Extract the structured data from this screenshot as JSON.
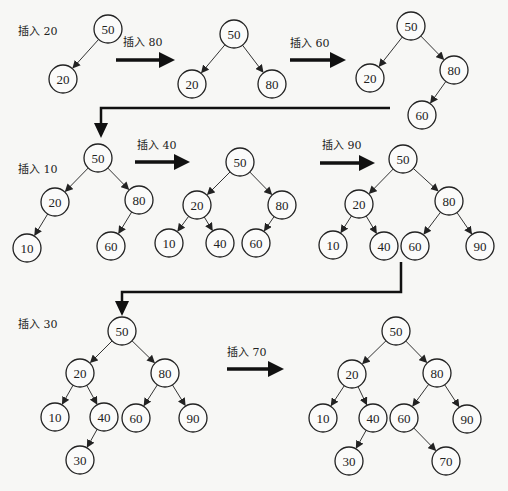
{
  "diagram": {
    "colors": {
      "stroke": "#222222",
      "background": "#f7f7f5",
      "node_fill": "#fbfbfa"
    },
    "node_radius": 14,
    "steps": [
      {
        "label": "插入 20",
        "label_pos": [
          18,
          35
        ],
        "nodes": [
          {
            "v": "50",
            "x": 108,
            "y": 29
          },
          {
            "v": "20",
            "x": 63,
            "y": 79
          }
        ],
        "edges": [
          [
            "50",
            "20"
          ]
        ]
      },
      {
        "label": "插入 80",
        "label_pos": [
          123,
          46
        ],
        "arrow": {
          "x1": 116,
          "y1": 60,
          "x2": 175,
          "y2": 60
        },
        "nodes": [
          {
            "v": "50",
            "x": 234,
            "y": 34
          },
          {
            "v": "20",
            "x": 192,
            "y": 84
          },
          {
            "v": "80",
            "x": 272,
            "y": 84
          }
        ],
        "edges": [
          [
            "50",
            "20"
          ],
          [
            "50",
            "80"
          ]
        ]
      },
      {
        "label": "插入 60",
        "label_pos": [
          290,
          47
        ],
        "arrow": {
          "x1": 290,
          "y1": 60,
          "x2": 346,
          "y2": 60
        },
        "nodes": [
          {
            "v": "50",
            "x": 411,
            "y": 26
          },
          {
            "v": "20",
            "x": 370,
            "y": 78
          },
          {
            "v": "80",
            "x": 454,
            "y": 70
          },
          {
            "v": "60",
            "x": 422,
            "y": 115
          }
        ],
        "edges": [
          [
            "50",
            "20"
          ],
          [
            "50",
            "80"
          ],
          [
            "80",
            "60"
          ]
        ]
      },
      {
        "label": "插入 10",
        "label_pos": [
          18,
          173
        ],
        "nodes": [
          {
            "v": "50",
            "x": 98,
            "y": 158
          },
          {
            "v": "20",
            "x": 55,
            "y": 202
          },
          {
            "v": "80",
            "x": 139,
            "y": 200
          },
          {
            "v": "10",
            "x": 27,
            "y": 248
          },
          {
            "v": "60",
            "x": 111,
            "y": 246
          }
        ],
        "edges": [
          [
            "50",
            "20"
          ],
          [
            "50",
            "80"
          ],
          [
            "20",
            "10"
          ],
          [
            "80",
            "60"
          ]
        ]
      },
      {
        "label": "插入 40",
        "label_pos": [
          137,
          149
        ],
        "arrow": {
          "x1": 135,
          "y1": 162,
          "x2": 190,
          "y2": 162
        },
        "nodes": [
          {
            "v": "50",
            "x": 240,
            "y": 162
          },
          {
            "v": "20",
            "x": 197,
            "y": 205
          },
          {
            "v": "80",
            "x": 282,
            "y": 205
          },
          {
            "v": "10",
            "x": 169,
            "y": 243
          },
          {
            "v": "40",
            "x": 220,
            "y": 243
          },
          {
            "v": "60",
            "x": 256,
            "y": 243
          }
        ],
        "edges": [
          [
            "50",
            "20"
          ],
          [
            "50",
            "80"
          ],
          [
            "20",
            "10"
          ],
          [
            "20",
            "40"
          ],
          [
            "80",
            "60"
          ]
        ]
      },
      {
        "label": "插入 90",
        "label_pos": [
          322,
          149
        ],
        "arrow": {
          "x1": 320,
          "y1": 163,
          "x2": 375,
          "y2": 163
        },
        "nodes": [
          {
            "v": "50",
            "x": 403,
            "y": 159
          },
          {
            "v": "20",
            "x": 359,
            "y": 204
          },
          {
            "v": "80",
            "x": 449,
            "y": 201
          },
          {
            "v": "10",
            "x": 333,
            "y": 245
          },
          {
            "v": "40",
            "x": 384,
            "y": 246
          },
          {
            "v": "60",
            "x": 415,
            "y": 246
          },
          {
            "v": "90",
            "x": 480,
            "y": 246
          }
        ],
        "edges": [
          [
            "50",
            "20"
          ],
          [
            "50",
            "80"
          ],
          [
            "20",
            "10"
          ],
          [
            "20",
            "40"
          ],
          [
            "80",
            "60"
          ],
          [
            "80",
            "90"
          ]
        ]
      },
      {
        "label": "插入 30",
        "label_pos": [
          18,
          328
        ],
        "nodes": [
          {
            "v": "50",
            "x": 122,
            "y": 331
          },
          {
            "v": "20",
            "x": 80,
            "y": 373
          },
          {
            "v": "80",
            "x": 165,
            "y": 373
          },
          {
            "v": "10",
            "x": 55,
            "y": 417
          },
          {
            "v": "40",
            "x": 104,
            "y": 417
          },
          {
            "v": "60",
            "x": 136,
            "y": 418
          },
          {
            "v": "90",
            "x": 193,
            "y": 418
          },
          {
            "v": "30",
            "x": 80,
            "y": 460
          }
        ],
        "edges": [
          [
            "50",
            "20"
          ],
          [
            "50",
            "80"
          ],
          [
            "20",
            "10"
          ],
          [
            "20",
            "40"
          ],
          [
            "80",
            "60"
          ],
          [
            "80",
            "90"
          ],
          [
            "40",
            "30"
          ]
        ]
      },
      {
        "label": "插入 70",
        "label_pos": [
          227,
          356
        ],
        "arrow": {
          "x1": 227,
          "y1": 369,
          "x2": 284,
          "y2": 369
        },
        "nodes": [
          {
            "v": "50",
            "x": 396,
            "y": 331
          },
          {
            "v": "20",
            "x": 352,
            "y": 374
          },
          {
            "v": "80",
            "x": 437,
            "y": 373
          },
          {
            "v": "10",
            "x": 323,
            "y": 418
          },
          {
            "v": "40",
            "x": 373,
            "y": 418
          },
          {
            "v": "60",
            "x": 404,
            "y": 418
          },
          {
            "v": "90",
            "x": 467,
            "y": 419
          },
          {
            "v": "30",
            "x": 349,
            "y": 461
          },
          {
            "v": "70",
            "x": 446,
            "y": 461
          }
        ],
        "edges": [
          [
            "50",
            "20"
          ],
          [
            "50",
            "80"
          ],
          [
            "20",
            "10"
          ],
          [
            "20",
            "40"
          ],
          [
            "80",
            "60"
          ],
          [
            "80",
            "90"
          ],
          [
            "40",
            "30"
          ],
          [
            "60",
            "70"
          ]
        ]
      }
    ],
    "connectors": [
      {
        "points": [
          [
            390,
            108
          ],
          [
            101,
            108
          ],
          [
            101,
            125
          ]
        ],
        "head": [
          101,
          138
        ]
      },
      {
        "points": [
          [
            401,
            262
          ],
          [
            401,
            292
          ],
          [
            122,
            292
          ],
          [
            122,
            303
          ]
        ],
        "head": [
          122,
          316
        ]
      }
    ]
  }
}
